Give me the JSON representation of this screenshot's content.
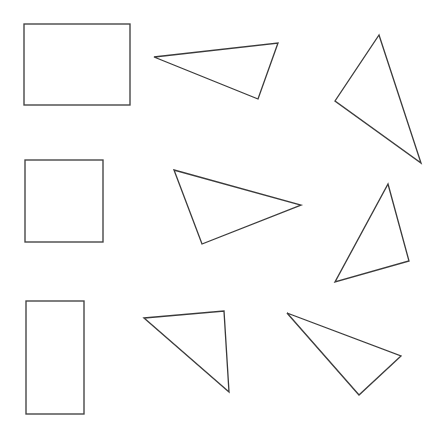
{
  "canvas": {
    "width": 443,
    "height": 422,
    "background": "#ffffff",
    "stroke": "#3a3a3a"
  },
  "shapes": {
    "rectangles": [
      {
        "id": "rect-1",
        "x": 24,
        "y": 24,
        "w": 106,
        "h": 81
      },
      {
        "id": "square-1",
        "x": 25,
        "y": 160,
        "w": 78,
        "h": 82
      },
      {
        "id": "rect-2",
        "x": 26,
        "y": 301,
        "w": 58,
        "h": 113
      }
    ],
    "triangles": [
      {
        "id": "triangle-1",
        "points": "154,57 278,43 258,99"
      },
      {
        "id": "triangle-2",
        "points": "379,35 335,101 421,163"
      },
      {
        "id": "triangle-3",
        "points": "174,170 301,205 202,244"
      },
      {
        "id": "triangle-4",
        "points": "388,184 409,261 335,282"
      },
      {
        "id": "triangle-5",
        "points": "144,318 224,311 229,392"
      },
      {
        "id": "triangle-6",
        "points": "287,313 401,356 359,395"
      }
    ]
  }
}
